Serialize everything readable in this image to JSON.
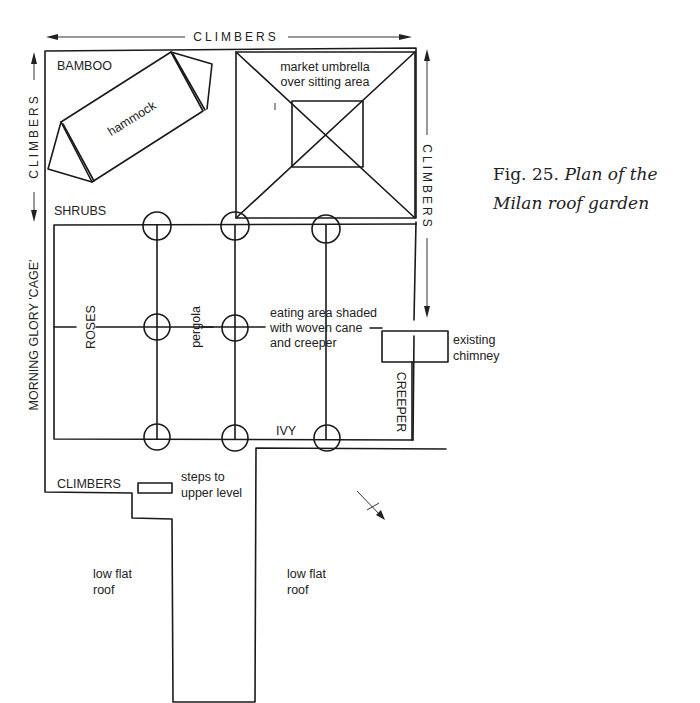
{
  "caption": {
    "fig_label": "Fig. 25.",
    "title_line1": "Plan of the",
    "title_line2": "Milan roof garden"
  },
  "labels": {
    "climbers_top": "CLIMBERS",
    "climbers_left": "CLIMBERS",
    "climbers_right": "CLIMBERS",
    "climbers_bottom": "CLIMBERS",
    "bamboo": "BAMBOO",
    "hammock": "hammock",
    "umbrella_line1": "market umbrella",
    "umbrella_line2": "over sitting area",
    "shrubs": "SHRUBS",
    "roses": "ROSES",
    "pergola": "pergola",
    "morning_glory": "MORNING GLORY 'CAGE'",
    "eating_line1": "eating area shaded",
    "eating_line2": "with woven cane",
    "eating_line3": "and creeper",
    "chimney_line1": "existing",
    "chimney_line2": "chimney",
    "creeper": "CREEPER",
    "ivy": "IVY",
    "steps_line1": "steps to",
    "steps_line2": "upper level",
    "low_roof_left_line1": "low flat",
    "low_roof_left_line2": "roof",
    "low_roof_right_line1": "low flat",
    "low_roof_right_line2": "roof"
  },
  "icons": {
    "north_arrow": "north-arrow-icon"
  }
}
